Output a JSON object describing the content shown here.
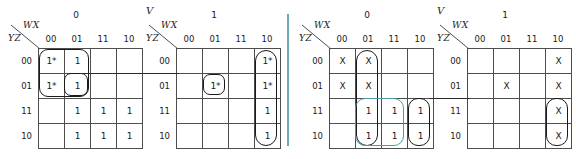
{
  "figure": {
    "type": "karnaugh-map-set",
    "divider_color": "#6ba9b5",
    "group_color": "#1b1b1b",
    "group_color_alt": "#4d9aa6"
  },
  "column_header_label": "WX",
  "row_header_label": "YZ",
  "column_values": [
    "00",
    "01",
    "11",
    "10"
  ],
  "row_values": [
    "00",
    "01",
    "11",
    "10"
  ],
  "maps": [
    {
      "id": "map-1",
      "v_label": "",
      "v_value": "0",
      "cells": [
        [
          "1*",
          "1",
          "",
          ""
        ],
        [
          "1*",
          "1",
          "",
          ""
        ],
        [
          "",
          "1",
          "1",
          "1"
        ],
        [
          "",
          "1",
          "1",
          "1"
        ]
      ]
    },
    {
      "id": "map-2",
      "v_label": "V",
      "v_value": "1",
      "cells": [
        [
          "",
          "",
          "",
          "1*"
        ],
        [
          "",
          "1*",
          "",
          "1*"
        ],
        [
          "",
          "",
          "",
          "1"
        ],
        [
          "",
          "",
          "",
          "1"
        ]
      ]
    },
    {
      "id": "map-3",
      "v_label": "",
      "v_value": "0",
      "cells": [
        [
          "X",
          "X",
          "",
          ""
        ],
        [
          "X",
          "X",
          "",
          ""
        ],
        [
          "",
          "1",
          "1",
          "1"
        ],
        [
          "",
          "1",
          "1",
          "1"
        ]
      ]
    },
    {
      "id": "map-4",
      "v_label": "V",
      "v_value": "1",
      "cells": [
        [
          "",
          "",
          "",
          "X"
        ],
        [
          "",
          "X",
          "",
          "X"
        ],
        [
          "",
          "",
          "",
          "X"
        ],
        [
          "",
          "",
          "",
          "X"
        ]
      ]
    }
  ]
}
